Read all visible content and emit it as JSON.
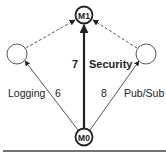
{
  "diagram": {
    "nodes": [
      {
        "id": "M1",
        "label": "M1",
        "x": 84,
        "y": 15,
        "r": 9,
        "bold": true
      },
      {
        "id": "M0",
        "label": "M0",
        "x": 84,
        "y": 137,
        "r": 9,
        "bold": true
      },
      {
        "id": "left",
        "label": "",
        "x": 17,
        "y": 54,
        "r": 10,
        "bold": false
      },
      {
        "id": "right",
        "label": "",
        "x": 146,
        "y": 54,
        "r": 10,
        "bold": false
      }
    ],
    "edges": [
      {
        "from": "M0",
        "to": "M1",
        "style": "solid-bold",
        "weight": "7",
        "label": "Security"
      },
      {
        "from": "M0",
        "to": "left",
        "style": "solid",
        "weight": "6",
        "label": "Logging"
      },
      {
        "from": "M0",
        "to": "right",
        "style": "solid",
        "weight": "8",
        "label": "Pub/Sub"
      },
      {
        "from": "left",
        "to": "M1",
        "style": "dashed",
        "weight": "",
        "label": ""
      },
      {
        "from": "right",
        "to": "M1",
        "style": "dashed",
        "weight": "",
        "label": ""
      }
    ],
    "labels": {
      "m1": "M1",
      "m0": "M0",
      "security_weight": "7",
      "security": "Security",
      "logging": "Logging",
      "logging_weight": "6",
      "pubsub_weight": "8",
      "pubsub": "Pub/Sub"
    },
    "colors": {
      "stroke": "#222222",
      "dashed": "#555555",
      "background": "#ffffff"
    }
  }
}
